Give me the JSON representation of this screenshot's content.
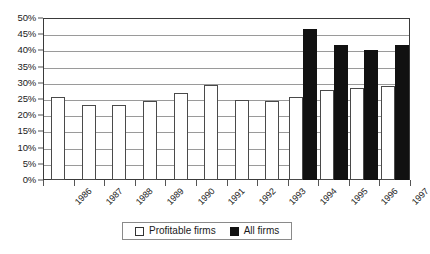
{
  "chart_data": {
    "type": "bar",
    "title": "",
    "xlabel": "",
    "ylabel": "",
    "ylim": [
      0,
      50
    ],
    "y_unit": "%",
    "grid": true,
    "legend_position": "bottom",
    "categories": [
      "1986",
      "1987",
      "1988",
      "1989",
      "1990",
      "1991",
      "1992",
      "1993",
      "1994",
      "1995",
      "1996",
      "1997"
    ],
    "y_ticks": [
      "0%",
      "5%",
      "10%",
      "15%",
      "20%",
      "25%",
      "30%",
      "35%",
      "40%",
      "45%",
      "50%"
    ],
    "y_tick_values": [
      0,
      5,
      10,
      15,
      20,
      25,
      30,
      35,
      40,
      45,
      50
    ],
    "series": [
      {
        "name": "Profitable firms",
        "color": "#ffffff",
        "edge_color": "#4a4a4a",
        "values": [
          25.7,
          23.0,
          23.0,
          24.3,
          27.0,
          29.2,
          24.7,
          24.3,
          25.6,
          27.9,
          28.5,
          29.1
        ]
      },
      {
        "name": "All firms",
        "color": "#111111",
        "edge_color": "#111111",
        "values": [
          null,
          null,
          null,
          null,
          null,
          null,
          null,
          null,
          46.7,
          41.8,
          40.2,
          41.8
        ]
      }
    ],
    "legend": [
      {
        "label": "Profitable firms",
        "swatch": "hollow-square"
      },
      {
        "label": "All firms",
        "swatch": "filled-square"
      }
    ]
  }
}
